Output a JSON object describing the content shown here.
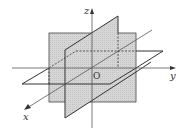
{
  "diagram": {
    "axes": {
      "x": {
        "label": "x"
      },
      "y": {
        "label": "y"
      },
      "z": {
        "label": "z"
      }
    },
    "origin_label": "O",
    "colors": {
      "plane_fill": "#d4d4d4",
      "line": "#333333",
      "background": "#ffffff"
    }
  }
}
